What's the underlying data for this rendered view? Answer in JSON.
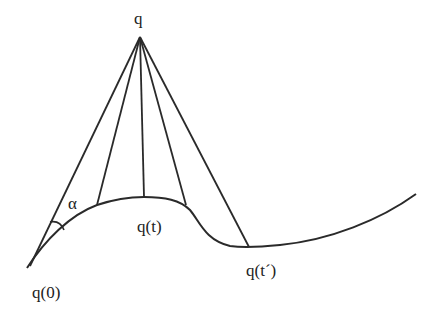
{
  "figure": {
    "labels": {
      "apex": "q",
      "alpha": "α",
      "q_t": "q(t)",
      "q_t_prime": "q(t´)",
      "q_0": "q(0)"
    },
    "colors": {
      "stroke": "#2a2a2a",
      "text": "#222222",
      "background": "#ffffff"
    }
  }
}
